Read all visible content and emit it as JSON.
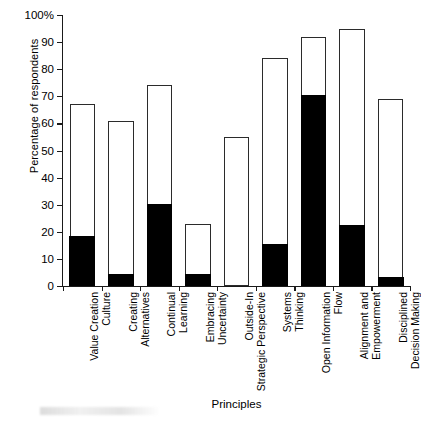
{
  "chart_data": {
    "type": "bar",
    "title": "",
    "subtitle": "",
    "xlabel": "Principles",
    "ylabel": "Percentage of respondents",
    "ylim": [
      0,
      100
    ],
    "ytick_labels": [
      "0",
      "10",
      "20",
      "30",
      "40",
      "50",
      "60",
      "70",
      "80",
      "90",
      "100%"
    ],
    "ytick_values": [
      0,
      10,
      20,
      30,
      40,
      50,
      60,
      70,
      80,
      90,
      100
    ],
    "grid": false,
    "legend": [],
    "legend_position": "none",
    "stacked": true,
    "categories": [
      "Value Creation Culture",
      "Creating Alternatives",
      "Continual Learning",
      "Embracing Uncertainty",
      "Outside-In Strategic Perspective",
      "Systems Thinking",
      "Open Information Flow",
      "Alignment and Empowerment",
      "Disciplined Decision Making"
    ],
    "category_lines": [
      [
        "Value Creation",
        "Culture"
      ],
      [
        "Creating",
        "Alternatives"
      ],
      [
        "Continual",
        "Learning"
      ],
      [
        "Embracing",
        "Uncertainty"
      ],
      [
        "Outside-In",
        "Strategic Perspective"
      ],
      [
        "Systems",
        "Thinking"
      ],
      [
        "Open Information",
        "Flow"
      ],
      [
        "Alignment and",
        "Empowerment"
      ],
      [
        "Disciplined",
        "Decision Making"
      ]
    ],
    "series": [
      {
        "name": "total",
        "color": "#ffffff",
        "values": [
          67,
          61,
          74,
          23,
          55,
          84,
          92,
          95,
          69
        ]
      },
      {
        "name": "filled",
        "color": "#000000",
        "values": [
          18,
          4,
          30,
          4,
          0,
          15,
          70,
          22,
          3
        ]
      }
    ]
  }
}
